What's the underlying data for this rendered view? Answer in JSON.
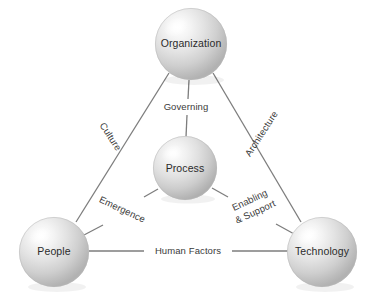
{
  "diagram": {
    "background_color": "#ffffff",
    "line_color": "#7d7d7d",
    "text_color": "#2b2b2b",
    "nodes": [
      {
        "id": "organization",
        "label": "Organization",
        "cx": 191,
        "cy": 44,
        "r": 36
      },
      {
        "id": "process",
        "label": "Process",
        "cx": 185,
        "cy": 168,
        "r": 32
      },
      {
        "id": "people",
        "label": "People",
        "cx": 54,
        "cy": 252,
        "r": 35
      },
      {
        "id": "technology",
        "label": "Technology",
        "cx": 322,
        "cy": 252,
        "r": 35
      }
    ],
    "edges": [
      {
        "id": "culture",
        "label": "Culture",
        "from": "organization",
        "to": "people",
        "label_x": 110,
        "label_y": 137,
        "rotation": 57
      },
      {
        "id": "architecture",
        "label": "Architecture",
        "from": "organization",
        "to": "technology",
        "label_x": 262,
        "label_y": 134,
        "rotation": -57
      },
      {
        "id": "governing",
        "label": "Governing",
        "from": "organization",
        "to": "process",
        "label_x": 186,
        "label_y": 107,
        "rotation": 0
      },
      {
        "id": "emergence",
        "label": "Emergence",
        "from": "process",
        "to": "people",
        "label_x": 122,
        "label_y": 210,
        "rotation": 25
      },
      {
        "id": "enabling-support",
        "label": "Enabling",
        "label_line2": "& Support",
        "from": "process",
        "to": "technology",
        "label_x": 253,
        "label_y": 207,
        "rotation": -25
      },
      {
        "id": "human-factors",
        "label": "Human Factors",
        "from": "people",
        "to": "technology",
        "label_x": 188,
        "label_y": 251,
        "rotation": 0
      }
    ]
  }
}
